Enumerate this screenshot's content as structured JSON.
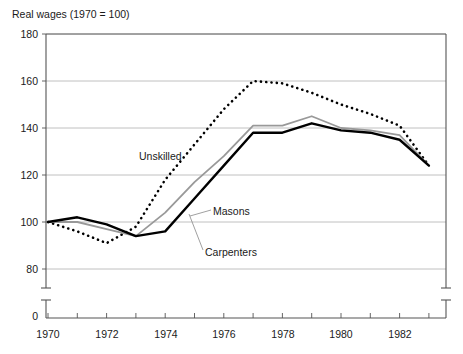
{
  "chart_data": {
    "type": "line",
    "title": "Real wages (1970 = 100)",
    "xlabel": "",
    "ylabel": "",
    "xlim": [
      1970,
      1983.5
    ],
    "ylim": [
      76,
      180
    ],
    "yticks": [
      180,
      160,
      140,
      120,
      100,
      80
    ],
    "y_axis_break": true,
    "y_origin_tick": 0,
    "xticks": [
      1970,
      1971,
      1972,
      1973,
      1974,
      1975,
      1976,
      1977,
      1978,
      1979,
      1980,
      1981,
      1982,
      1983
    ],
    "xtick_labels": [
      "1970",
      "1972",
      "1974",
      "1976",
      "1978",
      "1980",
      "1982"
    ],
    "xtick_label_values": [
      1970,
      1972,
      1974,
      1976,
      1978,
      1980,
      1982
    ],
    "grid": "horizontal",
    "legend_position": "inline-annotations",
    "x": [
      1970,
      1971,
      1972,
      1973,
      1974,
      1975,
      1976,
      1977,
      1978,
      1979,
      1980,
      1981,
      1982,
      1983
    ],
    "series": [
      {
        "name": "Unskilled",
        "style": "dotted",
        "color": "#000000",
        "values": [
          100,
          96,
          91,
          98,
          118,
          133,
          148,
          160,
          159,
          155,
          150,
          146,
          141,
          124
        ]
      },
      {
        "name": "Masons",
        "style": "solid-gray",
        "color": "#999999",
        "values": [
          100,
          100,
          97,
          94,
          104,
          117,
          128,
          141,
          141,
          145,
          140,
          139,
          137,
          124
        ]
      },
      {
        "name": "Carpenters",
        "style": "solid-black",
        "color": "#000000",
        "values": [
          100,
          102,
          99,
          94,
          96,
          110,
          124,
          138,
          138,
          142,
          139,
          138,
          135,
          124
        ]
      }
    ],
    "annotations": [
      {
        "text": "Unskilled",
        "x": 139,
        "y": 150
      },
      {
        "text": "Masons",
        "x": 213,
        "y": 205
      },
      {
        "text": "Carpenters",
        "x": 205,
        "y": 246
      }
    ]
  }
}
